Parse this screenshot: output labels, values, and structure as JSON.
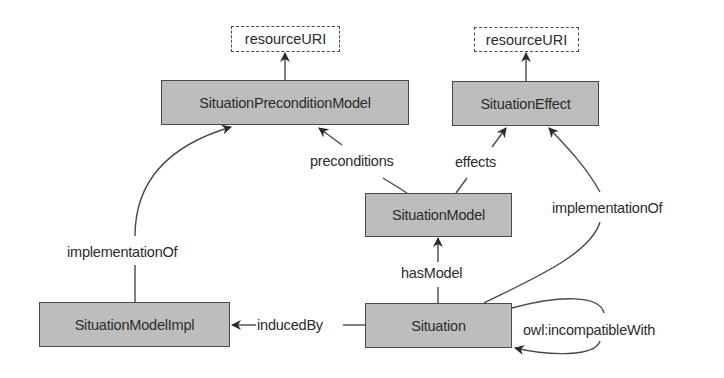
{
  "diagram": {
    "nodes": {
      "uri_left": "resourceURI",
      "uri_right": "resourceURI",
      "precondition_model": "SituationPreconditionModel",
      "effect": "SituationEffect",
      "situation_model": "SituationModel",
      "situation_model_impl": "SituationModelImpl",
      "situation": "Situation"
    },
    "edges": {
      "preconditions": "preconditions",
      "effects": "effects",
      "has_model": "hasModel",
      "induced_by": "inducedBy",
      "implementation_of_left": "implementationOf",
      "implementation_of_right": "implementationOf",
      "incompatible_with": "owl:incompatibleWith"
    },
    "colors": {
      "node_fill": "#bdbdbd",
      "stroke": "#4a4a4a",
      "text": "#2b2b2b"
    }
  }
}
